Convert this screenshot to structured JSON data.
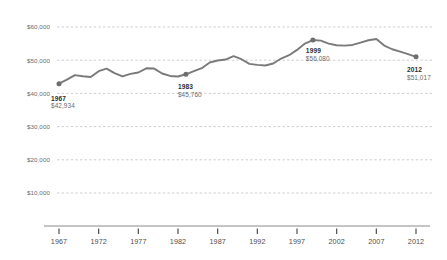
{
  "chart_data": {
    "type": "line",
    "title": "",
    "subtitle": "",
    "xlabel": "",
    "ylabel": "",
    "grid": true,
    "legend": false,
    "xlim": [
      1967,
      2012
    ],
    "ylim": [
      0,
      62000
    ],
    "y_ticks": [
      10000,
      20000,
      30000,
      40000,
      50000,
      60000
    ],
    "y_tick_labels": [
      "$10,000",
      "$20,000",
      "$30,000",
      "$40,000",
      "$50,000",
      "$60,000"
    ],
    "x_ticks": [
      1967,
      1972,
      1977,
      1982,
      1987,
      1992,
      1997,
      2002,
      2007,
      2012
    ],
    "x_tick_labels": [
      "1967",
      "1972",
      "1977",
      "1982",
      "1987",
      "1992",
      "1997",
      "2002",
      "2007",
      "2012"
    ],
    "line_color": "#7a7a7a",
    "grid_color": "#b9b9b9",
    "axis_color": "#8a8a8a",
    "marker_color": "#6e6e6e",
    "x": [
      1967,
      1968,
      1969,
      1970,
      1971,
      1972,
      1973,
      1974,
      1975,
      1976,
      1977,
      1978,
      1979,
      1980,
      1981,
      1982,
      1983,
      1984,
      1985,
      1986,
      1987,
      1988,
      1989,
      1990,
      1991,
      1992,
      1993,
      1994,
      1995,
      1996,
      1997,
      1998,
      1999,
      2000,
      2001,
      2002,
      2003,
      2004,
      2005,
      2006,
      2007,
      2008,
      2009,
      2010,
      2011,
      2012
    ],
    "values": [
      42934,
      44130,
      45490,
      45150,
      44920,
      46700,
      47460,
      46120,
      45130,
      45890,
      46300,
      47560,
      47480,
      46000,
      45260,
      45080,
      45760,
      46700,
      47580,
      49300,
      49900,
      50200,
      51200,
      50300,
      48900,
      48600,
      48400,
      49000,
      50500,
      51500,
      53100,
      55000,
      56080,
      55900,
      55000,
      54500,
      54400,
      54600,
      55300,
      56000,
      56400,
      54400,
      53300,
      52600,
      51800,
      51017
    ],
    "annotations": [
      {
        "name": "1967",
        "year": 1967,
        "value": 42934,
        "year_label": "1967",
        "value_label": "$42,934",
        "position": "below"
      },
      {
        "name": "1983",
        "year": 1983,
        "value": 45760,
        "year_label": "1983",
        "value_label": "$45,760",
        "position": "below"
      },
      {
        "name": "1999",
        "year": 1999,
        "value": 56080,
        "year_label": "1999",
        "value_label": "$56,080",
        "position": "below"
      },
      {
        "name": "2012",
        "year": 2012,
        "value": 51017,
        "year_label": "2012",
        "value_label": "$51,017",
        "position": "below"
      }
    ]
  },
  "y_axis": {
    "tick_0": "$10,000",
    "tick_1": "$20,000",
    "tick_2": "$30,000",
    "tick_3": "$40,000",
    "tick_4": "$50,000",
    "tick_5": "$60,000"
  },
  "x_axis": {
    "tick_0": "1967",
    "tick_1": "1972",
    "tick_2": "1977",
    "tick_3": "1982",
    "tick_4": "1987",
    "tick_5": "1992",
    "tick_6": "1997",
    "tick_7": "2002",
    "tick_8": "2007",
    "tick_9": "2012"
  },
  "annotations": {
    "a0": {
      "year": "1967",
      "value": "$42,934"
    },
    "a1": {
      "year": "1983",
      "value": "$45,760"
    },
    "a2": {
      "year": "1999",
      "value": "$56,080"
    },
    "a3": {
      "year": "2012",
      "value": "$51,017"
    }
  }
}
